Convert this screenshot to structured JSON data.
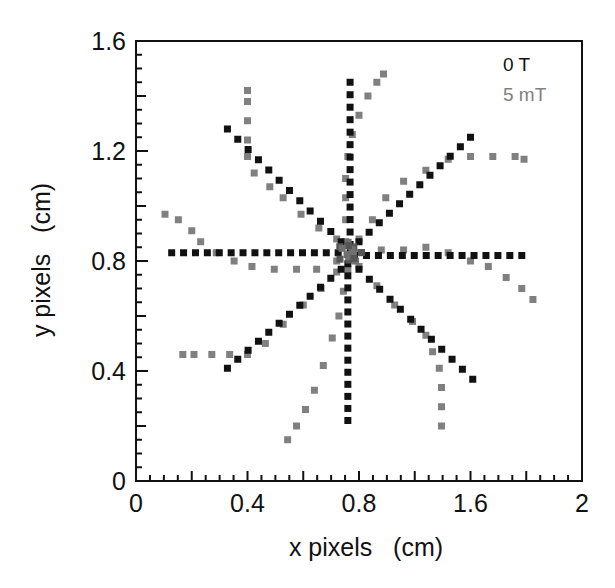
{
  "chart_data": {
    "type": "scatter",
    "title": "",
    "xlabel": "x pixels   (cm)",
    "ylabel": "y pixels   (cm)",
    "xlim": [
      0,
      2
    ],
    "ylim": [
      0,
      1.6
    ],
    "grid": false,
    "legend_position": "upper right (inside)",
    "x_tick_labels": [
      {
        "label": "0",
        "pos": 0
      },
      {
        "label": "0.4",
        "pos": 0.5
      },
      {
        "label": "0.8",
        "pos": 1.0
      },
      {
        "label": "1.6",
        "pos": 1.5
      },
      {
        "label": "2",
        "pos": 2.0
      }
    ],
    "y_tick_labels": [
      {
        "label": "0",
        "pos": 0
      },
      {
        "label": "0.4",
        "pos": 0.4
      },
      {
        "label": "0.8",
        "pos": 0.8
      },
      {
        "label": "1.2",
        "pos": 1.2
      },
      {
        "label": "1.6",
        "pos": 1.6
      }
    ],
    "series": [
      {
        "name": "0 T",
        "color": "#111111",
        "marker": "square",
        "description": "Eight straight radial arms from center (~0.96, 0.83)",
        "arms": [
          {
            "from": [
              0.96,
              0.83
            ],
            "to": [
              0.16,
              0.83
            ],
            "n": 16
          },
          {
            "from": [
              0.98,
              0.82
            ],
            "to": [
              1.73,
              0.82
            ],
            "n": 15
          },
          {
            "from": [
              0.96,
              0.86
            ],
            "to": [
              0.96,
              1.45
            ],
            "n": 14
          },
          {
            "from": [
              0.95,
              0.79
            ],
            "to": [
              0.95,
              0.22
            ],
            "n": 14
          },
          {
            "from": [
              0.92,
              0.87
            ],
            "to": [
              0.41,
              1.28
            ],
            "n": 12
          },
          {
            "from": [
              1.0,
              0.77
            ],
            "to": [
              1.51,
              0.37
            ],
            "n": 12
          },
          {
            "from": [
              1.0,
              0.87
            ],
            "to": [
              1.5,
              1.25
            ],
            "n": 12
          },
          {
            "from": [
              0.92,
              0.77
            ],
            "to": [
              0.41,
              0.41
            ],
            "n": 12
          }
        ]
      },
      {
        "name": "5 mT",
        "color": "#808080",
        "marker": "square",
        "description": "Eight curved (deflected) arms from center",
        "arms": [
          {
            "points": [
              [
                0.94,
                0.87
              ],
              [
                0.94,
                0.95
              ],
              [
                0.94,
                1.03
              ],
              [
                0.94,
                1.1
              ],
              [
                0.95,
                1.18
              ],
              [
                0.97,
                1.26
              ],
              [
                1.0,
                1.33
              ],
              [
                1.04,
                1.4
              ],
              [
                1.08,
                1.45
              ],
              [
                1.11,
                1.48
              ]
            ]
          },
          {
            "points": [
              [
                0.9,
                0.88
              ],
              [
                0.82,
                0.92
              ],
              [
                0.74,
                0.97
              ],
              [
                0.66,
                1.03
              ],
              [
                0.6,
                1.07
              ],
              [
                0.53,
                1.12
              ],
              [
                0.5,
                1.18
              ],
              [
                0.5,
                1.24
              ],
              [
                0.5,
                1.31
              ],
              [
                0.5,
                1.38
              ],
              [
                0.5,
                1.42
              ]
            ]
          },
          {
            "points": [
              [
                0.9,
                0.8
              ],
              [
                0.81,
                0.77
              ],
              [
                0.72,
                0.77
              ],
              [
                0.62,
                0.77
              ],
              [
                0.52,
                0.78
              ],
              [
                0.44,
                0.8
              ],
              [
                0.36,
                0.83
              ],
              [
                0.29,
                0.87
              ],
              [
                0.25,
                0.91
              ],
              [
                0.19,
                0.95
              ],
              [
                0.13,
                0.97
              ]
            ]
          },
          {
            "points": [
              [
                0.9,
                0.76
              ],
              [
                0.83,
                0.7
              ],
              [
                0.75,
                0.64
              ],
              [
                0.66,
                0.57
              ],
              [
                0.58,
                0.5
              ],
              [
                0.5,
                0.46
              ],
              [
                0.42,
                0.46
              ],
              [
                0.34,
                0.46
              ],
              [
                0.26,
                0.46
              ],
              [
                0.21,
                0.46
              ]
            ]
          },
          {
            "points": [
              [
                0.95,
                0.77
              ],
              [
                0.93,
                0.69
              ],
              [
                0.91,
                0.6
              ],
              [
                0.88,
                0.52
              ],
              [
                0.84,
                0.42
              ],
              [
                0.8,
                0.33
              ],
              [
                0.76,
                0.26
              ],
              [
                0.72,
                0.2
              ],
              [
                0.68,
                0.15
              ]
            ]
          },
          {
            "points": [
              [
                1.0,
                0.78
              ],
              [
                1.08,
                0.71
              ],
              [
                1.16,
                0.64
              ],
              [
                1.24,
                0.58
              ],
              [
                1.3,
                0.53
              ],
              [
                1.33,
                0.47
              ],
              [
                1.36,
                0.41
              ],
              [
                1.37,
                0.34
              ],
              [
                1.37,
                0.27
              ],
              [
                1.37,
                0.2
              ]
            ]
          },
          {
            "points": [
              [
                1.0,
                0.83
              ],
              [
                1.1,
                0.84
              ],
              [
                1.2,
                0.84
              ],
              [
                1.3,
                0.85
              ],
              [
                1.4,
                0.83
              ],
              [
                1.5,
                0.8
              ],
              [
                1.58,
                0.78
              ],
              [
                1.66,
                0.74
              ],
              [
                1.73,
                0.7
              ],
              [
                1.78,
                0.66
              ]
            ]
          },
          {
            "points": [
              [
                1.0,
                0.88
              ],
              [
                1.06,
                0.95
              ],
              [
                1.12,
                1.03
              ],
              [
                1.2,
                1.09
              ],
              [
                1.3,
                1.13
              ],
              [
                1.4,
                1.17
              ],
              [
                1.5,
                1.18
              ],
              [
                1.6,
                1.18
              ],
              [
                1.7,
                1.18
              ],
              [
                1.74,
                1.17
              ]
            ]
          }
        ]
      }
    ]
  },
  "legend": {
    "items": [
      {
        "label": "0 T",
        "color": "#111111"
      },
      {
        "label": "5 mT",
        "color": "#808080"
      }
    ]
  },
  "axes": {
    "xlabel": "x pixels   (cm)",
    "ylabel": "y pixels   (cm)"
  }
}
